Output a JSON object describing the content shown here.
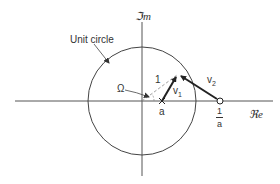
{
  "diagram": {
    "type": "complex-plane",
    "axes": {
      "real_label": "ℜe",
      "imag_label": "ℑm"
    },
    "labels": {
      "unit_circle": "Unit circle",
      "omega": "Ω",
      "radius": "1",
      "point_a": "a",
      "inverse_num": "1",
      "inverse_den": "a",
      "v1": "v",
      "v1_sub": "1",
      "v2": "v",
      "v2_sub": "2"
    },
    "geometry": {
      "origin": [
        142,
        101
      ],
      "circle_radius": 54,
      "point_a": [
        162,
        101
      ],
      "point_inverse_a": [
        220,
        101
      ],
      "point_on_circle": [
        178,
        74
      ]
    },
    "colors": {
      "line": "#444444",
      "text": "#333333",
      "dashed": "#888888"
    }
  }
}
